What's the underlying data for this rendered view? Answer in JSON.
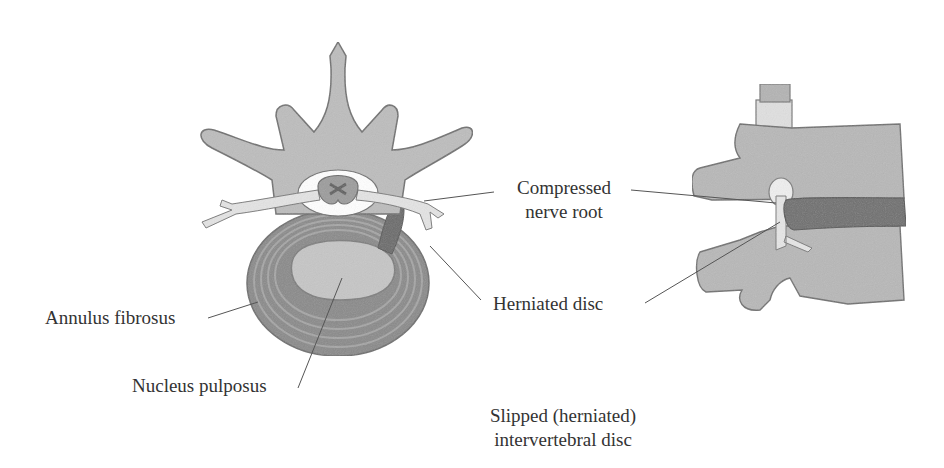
{
  "figure": {
    "caption_line1": "Slipped (herniated)",
    "caption_line2": "intervertebral disc",
    "colors": {
      "background": "#ffffff",
      "bone": "#b8b8b8",
      "bone_dark": "#8f8f8f",
      "outline": "#6e6e6e",
      "nerve": "#e2e2e2",
      "disc_ring": "#7a7a7a",
      "nucleus": "#c9c9c9",
      "herniation": "#5a5a5a",
      "text": "#333333",
      "leader": "#555555"
    }
  },
  "labels": {
    "annulus": "Annulus fibrosus",
    "nucleus": "Nucleus pulposus",
    "compressed_line1": "Compressed",
    "compressed_line2": "nerve root",
    "herniated": "Herniated disc"
  }
}
